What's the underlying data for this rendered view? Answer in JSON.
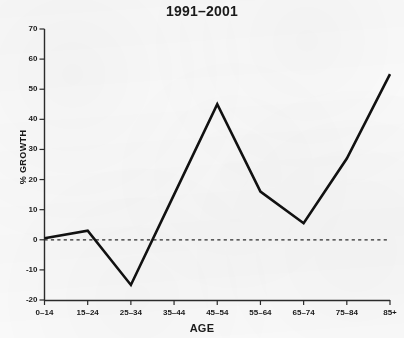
{
  "chart_data": {
    "type": "line",
    "title": "1991–2001",
    "xlabel": "AGE",
    "ylabel": "% GROWTH",
    "categories": [
      "0–14",
      "15–24",
      "25–34",
      "35–44",
      "45–54",
      "55–64",
      "65–74",
      "75–84",
      "85+"
    ],
    "values": [
      0.5,
      3,
      -15,
      15,
      45,
      16,
      5.5,
      27,
      55
    ],
    "ylim": [
      -20,
      70
    ],
    "ytick_labels": [
      "70",
      "60",
      "50",
      "40",
      "30",
      "20",
      "10",
      "0",
      "-10",
      "-20"
    ],
    "ytick_values": [
      70,
      60,
      50,
      40,
      30,
      20,
      10,
      0,
      -10,
      -20
    ],
    "grid": false,
    "legend": null,
    "zero_reference_line": {
      "value": 0,
      "style": "dashed"
    },
    "series": [
      {
        "name": "% growth",
        "values": [
          0.5,
          3,
          -15,
          15,
          45,
          16,
          5.5,
          27,
          55
        ]
      }
    ]
  },
  "style": {
    "line_color": "#111111",
    "axis_color": "#333333",
    "text_color": "#1a1a1a",
    "background": "#fbfbfb"
  }
}
